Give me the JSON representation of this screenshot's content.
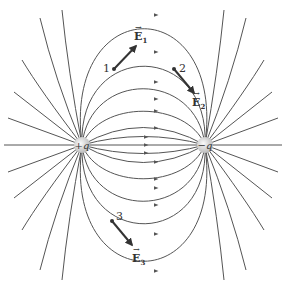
{
  "diagram": {
    "charges": [
      {
        "id": "positive",
        "label": "+q",
        "x": 82,
        "y": 145
      },
      {
        "id": "negative",
        "label": "−q",
        "x": 205,
        "y": 145
      }
    ],
    "points": [
      {
        "id": "1",
        "label": "1",
        "field_label": "E",
        "field_sub": "1"
      },
      {
        "id": "2",
        "label": "2",
        "field_label": "E",
        "field_sub": "2"
      },
      {
        "id": "3",
        "label": "3",
        "field_label": "E",
        "field_sub": "3"
      }
    ],
    "colors": {
      "line": "#555555",
      "vector": "#333333",
      "charge": "#cfcfcf"
    }
  }
}
